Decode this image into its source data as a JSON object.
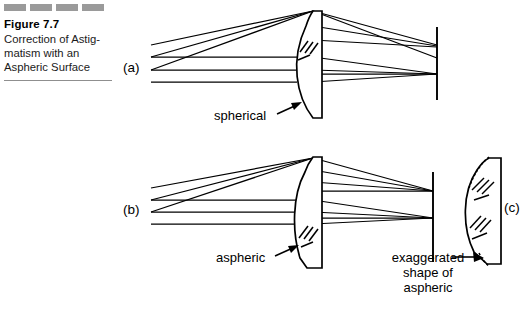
{
  "figure": {
    "number": "Figure 7.7",
    "caption_lines": [
      "Correction of Astig-",
      "matism with an",
      "Aspheric Surface"
    ],
    "caption_full": "Correction of Astigmatism with an Aspheric Surface",
    "dash_count": 4,
    "dash_color": "#9a9a9a",
    "rule_color": "#8f8f8f"
  },
  "diagram": {
    "type": "optical-ray-diagram",
    "line_color": "#000000",
    "background": "#ffffff",
    "panels": [
      {
        "id": "a",
        "label": "(a)",
        "surface_label": "spherical",
        "description": "Oblique and axial ray bundles through a plano-convex spherical surface; oblique bundle does not focus on the image plane (astigmatism).",
        "element": "plano-convex lens, spherical front surface",
        "image_plane": true,
        "corrected": false
      },
      {
        "id": "b",
        "label": "(b)",
        "surface_label": "aspheric",
        "description": "Same bundles through an aspheric front surface; both bundles focus on the image plane (astigmatism corrected).",
        "element": "plano-convex lens, aspheric front surface",
        "image_plane": true,
        "corrected": true
      },
      {
        "id": "c",
        "label": "(c)",
        "callout_lines": [
          "exaggerated",
          "shape of",
          "aspheric"
        ],
        "callout_full": "exaggerated shape of aspheric",
        "description": "Enlarged lens element with dashed reference sphere compared to the solid aspheric profile.",
        "reference_curve_style": "dashed",
        "aspheric_curve_style": "solid"
      }
    ],
    "annotations": {
      "arrow_to_spherical": "arrow pointing to spherical surface",
      "arrow_to_aspheric": "arrow pointing to aspheric surface",
      "arrow_to_exaggerated": "arrow pointing to exaggerated aspheric element",
      "hatching": "glass cross-section hatching"
    }
  }
}
